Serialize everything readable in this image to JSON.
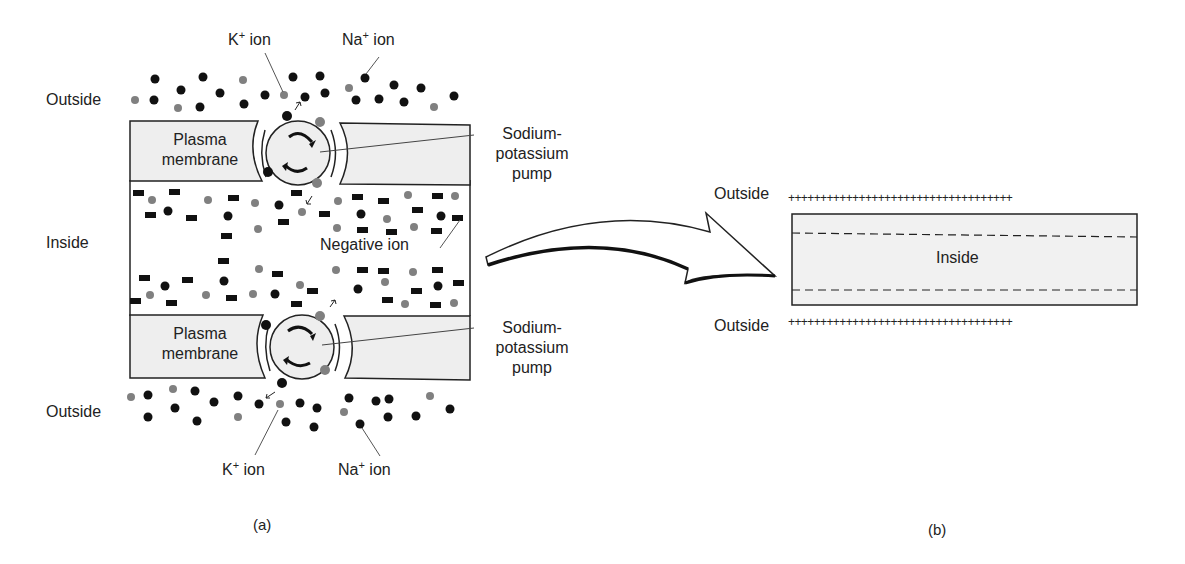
{
  "panel_a": {
    "caption": "(a)",
    "labels": {
      "outside_top": "Outside",
      "outside_bottom": "Outside",
      "inside": "Inside",
      "membrane_top_line1": "Plasma",
      "membrane_top_line2": "membrane",
      "membrane_bottom_line1": "Plasma",
      "membrane_bottom_line2": "membrane",
      "pump_top_line1": "Sodium-",
      "pump_top_line2": "potassium",
      "pump_top_line3": "pump",
      "pump_bottom_line1": "Sodium-",
      "pump_bottom_line2": "potassium",
      "pump_bottom_line3": "pump",
      "negative_ion": "Negative ion",
      "k_ion_top": "K",
      "k_ion_top_sup": "+",
      "k_ion_top_suffix": " ion",
      "na_ion_top": "Na",
      "na_ion_top_sup": "+",
      "na_ion_top_suffix": " ion",
      "k_ion_bottom": "K",
      "k_ion_bottom_sup": "+",
      "k_ion_bottom_suffix": " ion",
      "na_ion_bottom": "Na",
      "na_ion_bottom_sup": "+",
      "na_ion_bottom_suffix": " ion"
    }
  },
  "panel_b": {
    "caption": "(b)",
    "labels": {
      "outside_top": "Outside",
      "outside_bottom": "Outside",
      "inside": "Inside",
      "plus_top": "+++++++++++++++++++++++++++++++++++",
      "plus_bottom": "+++++++++++++++++++++++++++++++++++"
    }
  },
  "colors": {
    "membrane_fill": "#eeeeee",
    "outline": "#222222",
    "k_ion": "#111111",
    "na_ion": "#808080",
    "negative_ion": "#111111"
  },
  "legend": {
    "k_ion_color": "black dot",
    "na_ion_color": "gray dot",
    "negative_ion_shape": "black bar"
  }
}
